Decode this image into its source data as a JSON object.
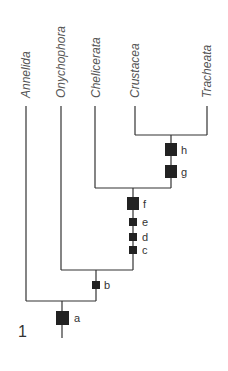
{
  "figure": {
    "number": "1",
    "type": "cladogram"
  },
  "taxa": [
    {
      "name": "Annelida",
      "x": 26
    },
    {
      "name": "Onychophora",
      "x": 61
    },
    {
      "name": "Chelicerata",
      "x": 95
    },
    {
      "name": "Crustacea",
      "x": 135
    },
    {
      "name": "Tracheata",
      "x": 207
    }
  ],
  "characters": [
    {
      "label": "a",
      "size": "large"
    },
    {
      "label": "b",
      "size": "small"
    },
    {
      "label": "c",
      "size": "small"
    },
    {
      "label": "d",
      "size": "small"
    },
    {
      "label": "e",
      "size": "small"
    },
    {
      "label": "f",
      "size": "large"
    },
    {
      "label": "g",
      "size": "large"
    },
    {
      "label": "h",
      "size": "large"
    }
  ],
  "colors": {
    "line": "#333333",
    "marker": "#222222",
    "text": "#555555"
  }
}
